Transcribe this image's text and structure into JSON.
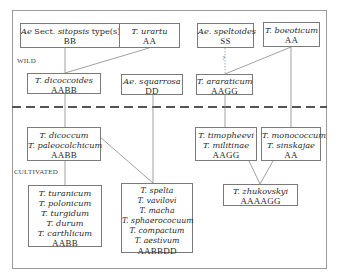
{
  "zones": {
    "wild": "WILD",
    "cultivated": "CULTIVATED"
  },
  "uncertain_mark": "?",
  "nodes": {
    "sitopsis": {
      "species": [
        [
          "Ae",
          " Sect. ",
          "sitopsis",
          " type(s)"
        ]
      ],
      "genome": "BB"
    },
    "urartu": {
      "species": [
        "T. urartu"
      ],
      "genome": "AA"
    },
    "speltoides": {
      "species": [
        "Ae. speltoides"
      ],
      "genome": "SS"
    },
    "boeoticum": {
      "species": [
        "T. boeoticum"
      ],
      "genome": "AA"
    },
    "dicoccoides": {
      "species": [
        "T. dicoccoides"
      ],
      "genome": "AABB"
    },
    "squarrosa": {
      "species": [
        "Ae. squarrosa"
      ],
      "genome": "DD"
    },
    "araraticum": {
      "species": [
        "T. araraticum"
      ],
      "genome": "AAGG"
    },
    "dicoccum": {
      "species": [
        "T. dicoccum",
        "T. paleocolchicum"
      ],
      "genome": "AABB"
    },
    "timopheevi": {
      "species": [
        "T. timopheevi",
        "T. militinae"
      ],
      "genome": "AAGG"
    },
    "monococcum": {
      "species": [
        "T. monococcum",
        "T. sinskajae"
      ],
      "genome": "AA"
    },
    "turanicum": {
      "species": [
        "T. turanicum",
        "T. polonicum",
        "T. turgidum",
        "T. durum",
        "T. carthlicum"
      ],
      "genome": "AABB"
    },
    "spelta": {
      "species": [
        "T. spelta",
        "T. vavilovi",
        "T. macha",
        "T. sphaerococuum",
        "T. compactum",
        "T. aestivum"
      ],
      "genome": "AABBDD"
    },
    "zhukovskyi": {
      "species": [
        "T. zhukovskyi"
      ],
      "genome": "AAAAGG"
    }
  },
  "edges": [
    {
      "from": "sitopsis",
      "to": "dicoccoides",
      "style": "solid"
    },
    {
      "from": "urartu",
      "to": "dicoccoides",
      "style": "solid"
    },
    {
      "from": "speltoides",
      "to": "araraticum",
      "style": "dotted",
      "label": "?"
    },
    {
      "from": "boeoticum",
      "to": "araraticum",
      "style": "solid"
    },
    {
      "from": "dicoccoides",
      "to": "dicoccum",
      "style": "solid"
    },
    {
      "from": "squarrosa",
      "to": "spelta",
      "style": "solid"
    },
    {
      "from": "araraticum",
      "to": "timopheevi",
      "style": "solid"
    },
    {
      "from": "boeoticum",
      "to": "monococcum",
      "style": "solid"
    },
    {
      "from": "dicoccum",
      "to": "turanicum",
      "style": "solid"
    },
    {
      "from": "dicoccum",
      "to": "spelta",
      "style": "solid"
    },
    {
      "from": "timopheevi",
      "to": "zhukovskyi",
      "style": "solid"
    },
    {
      "from": "monococcum",
      "to": "zhukovskyi",
      "style": "solid"
    }
  ]
}
